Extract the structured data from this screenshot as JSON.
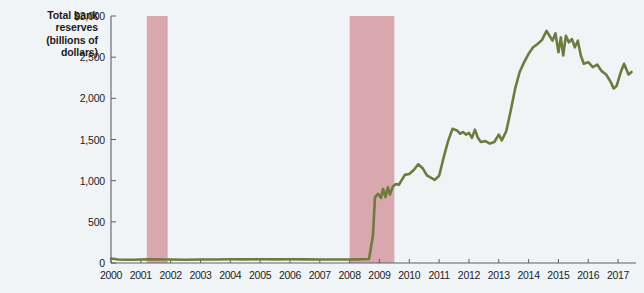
{
  "chart_data": {
    "type": "line",
    "title": "Total bank reserves (billions of dollars)",
    "title_lines": [
      "Total bank",
      "reserves",
      "(billions of",
      "dollars)"
    ],
    "xlabel": "",
    "ylabel": "Total bank reserves (billions of dollars)",
    "xlim": [
      2000,
      2017.6
    ],
    "ylim": [
      0,
      3000
    ],
    "grid": false,
    "legend": "none",
    "line_color": "#6e7a3e",
    "background_color": "#f1f4f6",
    "recession_color": "#d9a7ae",
    "ytick_labels": [
      "$3,000",
      "2,500",
      "2,000",
      "1,500",
      "1,000",
      "500",
      "0"
    ],
    "ytick_values": [
      3000,
      2500,
      2000,
      1500,
      1000,
      500,
      0
    ],
    "xtick_labels": [
      "2000",
      "2001",
      "2002",
      "2003",
      "2004",
      "2005",
      "2006",
      "2007",
      "2008",
      "2009",
      "2010",
      "2011",
      "2012",
      "2013",
      "2014",
      "2015",
      "2016",
      "2017"
    ],
    "xtick_values": [
      2000,
      2001,
      2002,
      2003,
      2004,
      2005,
      2006,
      2007,
      2008,
      2009,
      2010,
      2011,
      2012,
      2013,
      2014,
      2015,
      2016,
      2017
    ],
    "recession_bands": [
      {
        "start": 2001.2,
        "end": 2001.9
      },
      {
        "start": 2008.0,
        "end": 2009.5
      }
    ],
    "series": [
      {
        "name": "Total bank reserves",
        "color": "#6e7a3e",
        "points": [
          [
            2000.0,
            55
          ],
          [
            2000.25,
            42
          ],
          [
            2000.5,
            40
          ],
          [
            2000.75,
            40
          ],
          [
            2001.0,
            42
          ],
          [
            2001.25,
            45
          ],
          [
            2001.5,
            44
          ],
          [
            2001.75,
            42
          ],
          [
            2002.0,
            42
          ],
          [
            2002.5,
            40
          ],
          [
            2003.0,
            42
          ],
          [
            2003.5,
            42
          ],
          [
            2004.0,
            45
          ],
          [
            2004.5,
            44
          ],
          [
            2005.0,
            45
          ],
          [
            2005.5,
            44
          ],
          [
            2006.0,
            45
          ],
          [
            2006.5,
            44
          ],
          [
            2007.0,
            43
          ],
          [
            2007.5,
            42
          ],
          [
            2008.0,
            43
          ],
          [
            2008.25,
            44
          ],
          [
            2008.5,
            45
          ],
          [
            2008.65,
            48
          ],
          [
            2008.78,
            330
          ],
          [
            2008.85,
            800
          ],
          [
            2008.95,
            840
          ],
          [
            2009.05,
            790
          ],
          [
            2009.12,
            900
          ],
          [
            2009.2,
            800
          ],
          [
            2009.28,
            920
          ],
          [
            2009.35,
            830
          ],
          [
            2009.45,
            930
          ],
          [
            2009.55,
            960
          ],
          [
            2009.65,
            950
          ],
          [
            2009.75,
            1010
          ],
          [
            2009.85,
            1070
          ],
          [
            2010.0,
            1080
          ],
          [
            2010.15,
            1130
          ],
          [
            2010.3,
            1200
          ],
          [
            2010.45,
            1150
          ],
          [
            2010.6,
            1060
          ],
          [
            2010.75,
            1030
          ],
          [
            2010.85,
            1010
          ],
          [
            2011.0,
            1060
          ],
          [
            2011.15,
            1280
          ],
          [
            2011.3,
            1480
          ],
          [
            2011.45,
            1630
          ],
          [
            2011.6,
            1610
          ],
          [
            2011.7,
            1570
          ],
          [
            2011.8,
            1590
          ],
          [
            2011.9,
            1560
          ],
          [
            2012.0,
            1580
          ],
          [
            2012.1,
            1520
          ],
          [
            2012.2,
            1620
          ],
          [
            2012.3,
            1520
          ],
          [
            2012.4,
            1470
          ],
          [
            2012.55,
            1480
          ],
          [
            2012.7,
            1450
          ],
          [
            2012.85,
            1470
          ],
          [
            2013.0,
            1560
          ],
          [
            2013.1,
            1490
          ],
          [
            2013.25,
            1600
          ],
          [
            2013.4,
            1850
          ],
          [
            2013.55,
            2120
          ],
          [
            2013.7,
            2320
          ],
          [
            2013.85,
            2440
          ],
          [
            2014.0,
            2540
          ],
          [
            2014.15,
            2620
          ],
          [
            2014.3,
            2660
          ],
          [
            2014.45,
            2710
          ],
          [
            2014.6,
            2820
          ],
          [
            2014.7,
            2760
          ],
          [
            2014.8,
            2700
          ],
          [
            2014.9,
            2790
          ],
          [
            2015.0,
            2560
          ],
          [
            2015.08,
            2740
          ],
          [
            2015.16,
            2520
          ],
          [
            2015.25,
            2760
          ],
          [
            2015.35,
            2680
          ],
          [
            2015.45,
            2720
          ],
          [
            2015.55,
            2620
          ],
          [
            2015.65,
            2700
          ],
          [
            2015.75,
            2520
          ],
          [
            2015.85,
            2420
          ],
          [
            2016.0,
            2440
          ],
          [
            2016.15,
            2380
          ],
          [
            2016.3,
            2410
          ],
          [
            2016.45,
            2330
          ],
          [
            2016.6,
            2290
          ],
          [
            2016.75,
            2200
          ],
          [
            2016.85,
            2120
          ],
          [
            2016.95,
            2150
          ],
          [
            2017.1,
            2330
          ],
          [
            2017.2,
            2420
          ],
          [
            2017.35,
            2290
          ],
          [
            2017.45,
            2320
          ]
        ]
      }
    ]
  }
}
